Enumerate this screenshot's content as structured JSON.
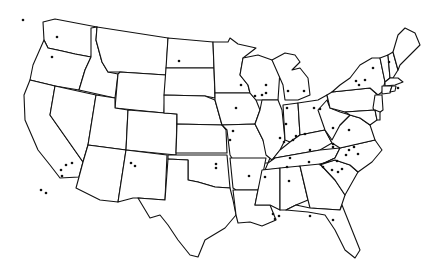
{
  "map": {
    "title": "",
    "region": "Contiguous United States",
    "style": {
      "background": "#ffffff",
      "state_fill": "#ffffff",
      "border_color": "#111111",
      "dot_color": "#111111"
    },
    "states": [
      {
        "id": "WA",
        "path": "M43,22 L55,19 L97,27 L91,57 L75,54 L62,51 L48,48 L44,40 Z"
      },
      {
        "id": "OR",
        "path": "M44,40 L48,48 L62,51 L75,54 L91,57 L85,70 L79,90 L55,86 L30,80 L33,65 Z"
      },
      {
        "id": "CA",
        "path": "M30,80 L55,86 L50,115 L83,162 L79,177 L60,178 L50,165 L38,150 L25,120 L24,95 Z"
      },
      {
        "id": "ID",
        "path": "M91,28 L97,27 L96,40 L102,62 L108,72 L118,74 L115,98 L79,90 L85,70 L91,57 Z"
      },
      {
        "id": "NV",
        "path": "M55,86 L96,95 L88,145 L83,162 L50,115 Z"
      },
      {
        "id": "MT",
        "path": "M97,27 L168,38 L166,75 L120,72 L108,72 L102,62 L96,40 Z"
      },
      {
        "id": "WY",
        "path": "M120,72 L166,75 L164,113 L115,108 L118,74 Z"
      },
      {
        "id": "UT",
        "path": "M96,95 L115,98 L115,108 L128,110 L126,150 L88,145 Z"
      },
      {
        "id": "AZ",
        "path": "M88,145 L126,150 L118,202 L100,200 L76,188 L79,177 L83,162 Z"
      },
      {
        "id": "CO",
        "path": "M128,110 L177,114 L176,155 L126,150 Z"
      },
      {
        "id": "NM",
        "path": "M126,150 L167,155 L165,200 L138,198 L133,198 L118,202 Z"
      },
      {
        "id": "ND",
        "path": "M168,38 L213,42 L214,68 L166,68 Z"
      },
      {
        "id": "SD",
        "path": "M166,68 L214,68 L215,98 L205,96 L164,95 Z"
      },
      {
        "id": "NE",
        "path": "M164,95 L205,96 L215,100 L222,125 L177,124 L177,114 L164,113 Z"
      },
      {
        "id": "KS",
        "path": "M177,124 L222,125 L226,130 L227,153 L176,153 Z"
      },
      {
        "id": "OK",
        "path": "M168,155 L227,155 L230,188 L215,187 L198,182 L188,180 L188,160 L168,159 Z"
      },
      {
        "id": "TX",
        "path": "M168,159 L188,160 L188,180 L198,182 L215,187 L230,188 L233,200 L236,215 L225,228 L205,240 L198,257 L190,255 L178,240 L168,225 L160,215 L150,218 L138,198 L165,200 Z"
      },
      {
        "id": "MN",
        "path": "M213,42 L228,42 L230,38 L238,44 L256,48 L243,58 L240,75 L248,85 L250,93 L215,93 L214,68 Z"
      },
      {
        "id": "IA",
        "path": "M215,93 L250,93 L256,100 L260,110 L255,124 L222,125 L215,100 Z"
      },
      {
        "id": "MO",
        "path": "M222,125 L255,124 L263,140 L270,158 L268,163 L235,163 L230,155 L227,130 Z"
      },
      {
        "id": "AR",
        "path": "M230,158 L266,158 L262,178 L258,190 L236,190 L233,188 Z"
      },
      {
        "id": "LA",
        "path": "M233,190 L258,190 L255,205 L270,205 L276,220 L262,226 L250,222 L238,223 L236,215 Z"
      },
      {
        "id": "WI",
        "path": "M243,58 L258,55 L272,60 L280,70 L278,100 L262,100 L256,100 L250,93 L248,85 L240,75 Z"
      },
      {
        "id": "IL",
        "path": "M262,100 L278,100 L282,110 L285,140 L280,150 L272,160 L266,155 L263,140 L255,124 L260,110 Z"
      },
      {
        "id": "MI",
        "path": "M272,60 L285,53 L295,55 L300,62 L292,70 L300,68 L308,78 L310,95 L298,100 L285,100 L283,85 Z"
      },
      {
        "id": "IN",
        "path": "M283,105 L298,103 L300,135 L290,142 L285,140 Z"
      },
      {
        "id": "OH",
        "path": "M298,103 L318,100 L327,95 L330,115 L325,130 L310,133 L300,135 Z"
      },
      {
        "id": "KY",
        "path": "M272,160 L280,150 L290,142 L300,135 L310,133 L325,130 L332,143 L320,150 L275,158 Z"
      },
      {
        "id": "TN",
        "path": "M268,163 L275,158 L320,150 L340,148 L335,158 L320,165 L265,170 Z"
      },
      {
        "id": "MS",
        "path": "M262,170 L280,168 L280,210 L270,205 L255,205 L258,190 Z"
      },
      {
        "id": "AL",
        "path": "M280,168 L300,166 L308,200 L296,205 L286,210 L280,210 Z"
      },
      {
        "id": "GA",
        "path": "M300,166 L320,164 L335,180 L345,195 L340,210 L310,208 L308,200 Z"
      },
      {
        "id": "FL",
        "path": "M286,210 L296,205 L310,208 L340,210 L342,205 L350,225 L360,250 L355,258 L345,250 L335,230 L325,215 L308,212 Z"
      },
      {
        "id": "SC",
        "path": "M320,164 L335,160 L350,165 L358,172 L345,195 L335,180 Z"
      },
      {
        "id": "NC",
        "path": "M320,165 L335,158 L340,148 L375,140 L382,150 L372,162 L358,172 L350,165 L335,160 Z"
      },
      {
        "id": "VA",
        "path": "M325,130 L332,143 L340,148 L375,140 L370,125 L360,118 L350,115 L340,125 Z"
      },
      {
        "id": "WV",
        "path": "M318,110 L327,100 L330,108 L340,112 L350,115 L340,125 L332,140 L325,130 Z"
      },
      {
        "id": "PA",
        "path": "M327,95 L332,92 L370,88 L378,95 L375,110 L345,112 L330,108 Z"
      },
      {
        "id": "NY",
        "path": "M332,92 L340,85 L350,78 L360,65 L372,58 L380,58 L385,82 L382,92 L378,95 L370,88 Z"
      },
      {
        "id": "NJ",
        "path": "M375,95 L382,95 L383,110 L376,115 L373,108 Z"
      },
      {
        "id": "MD",
        "path": "M345,112 L375,110 L377,120 L370,125 L360,118 L350,115 Z"
      },
      {
        "id": "DE",
        "path": "M375,110 L380,112 L380,120 L377,120 Z"
      },
      {
        "id": "VT",
        "path": "M380,58 L388,55 L390,78 L385,82 Z"
      },
      {
        "id": "NH",
        "path": "M388,55 L393,52 L398,70 L393,78 L390,78 Z"
      },
      {
        "id": "ME",
        "path": "M393,52 L398,35 L405,28 L415,33 L420,45 L410,55 L400,65 L398,70 Z"
      },
      {
        "id": "MA",
        "path": "M385,82 L390,78 L393,78 L398,78 L403,82 L395,85 L385,86 Z"
      },
      {
        "id": "CT",
        "path": "M382,86 L392,86 L390,93 L382,94 Z"
      },
      {
        "id": "RI",
        "path": "M392,86 L396,86 L395,91 L390,92 Z"
      }
    ],
    "markers": [
      {
        "x": 57,
        "y": 37
      },
      {
        "x": 52,
        "y": 57
      },
      {
        "x": 179,
        "y": 61
      },
      {
        "x": 41,
        "y": 190
      },
      {
        "x": 46,
        "y": 193
      },
      {
        "x": 66,
        "y": 165
      },
      {
        "x": 72,
        "y": 163
      },
      {
        "x": 61,
        "y": 170
      },
      {
        "x": 62,
        "y": 176
      },
      {
        "x": 131,
        "y": 163
      },
      {
        "x": 135,
        "y": 166
      },
      {
        "x": 216,
        "y": 164
      },
      {
        "x": 216,
        "y": 168
      },
      {
        "x": 236,
        "y": 108
      },
      {
        "x": 233,
        "y": 131
      },
      {
        "x": 230,
        "y": 140
      },
      {
        "x": 241,
        "y": 85
      },
      {
        "x": 266,
        "y": 93
      },
      {
        "x": 266,
        "y": 85
      },
      {
        "x": 262,
        "y": 95
      },
      {
        "x": 255,
        "y": 96
      },
      {
        "x": 288,
        "y": 91
      },
      {
        "x": 304,
        "y": 91
      },
      {
        "x": 287,
        "y": 108
      },
      {
        "x": 286,
        "y": 124
      },
      {
        "x": 280,
        "y": 138
      },
      {
        "x": 284,
        "y": 142
      },
      {
        "x": 314,
        "y": 108
      },
      {
        "x": 320,
        "y": 109
      },
      {
        "x": 296,
        "y": 136
      },
      {
        "x": 305,
        "y": 134
      },
      {
        "x": 293,
        "y": 140
      },
      {
        "x": 290,
        "y": 158
      },
      {
        "x": 287,
        "y": 167
      },
      {
        "x": 249,
        "y": 176
      },
      {
        "x": 265,
        "y": 177
      },
      {
        "x": 289,
        "y": 181
      },
      {
        "x": 273,
        "y": 214
      },
      {
        "x": 279,
        "y": 216
      },
      {
        "x": 275,
        "y": 219
      },
      {
        "x": 349,
        "y": 150
      },
      {
        "x": 337,
        "y": 161
      },
      {
        "x": 346,
        "y": 155
      },
      {
        "x": 354,
        "y": 147
      },
      {
        "x": 358,
        "y": 154
      },
      {
        "x": 342,
        "y": 169
      },
      {
        "x": 323,
        "y": 167
      },
      {
        "x": 332,
        "y": 170
      },
      {
        "x": 338,
        "y": 172
      },
      {
        "x": 309,
        "y": 162
      },
      {
        "x": 333,
        "y": 144
      },
      {
        "x": 349,
        "y": 130
      },
      {
        "x": 333,
        "y": 147
      },
      {
        "x": 310,
        "y": 150
      },
      {
        "x": 333,
        "y": 128
      },
      {
        "x": 373,
        "y": 68
      },
      {
        "x": 365,
        "y": 80
      },
      {
        "x": 356,
        "y": 81
      },
      {
        "x": 389,
        "y": 62
      },
      {
        "x": 398,
        "y": 88
      },
      {
        "x": 359,
        "y": 85
      },
      {
        "x": 333,
        "y": 220
      },
      {
        "x": 310,
        "y": 216
      },
      {
        "x": 23,
        "y": 20
      }
    ]
  }
}
